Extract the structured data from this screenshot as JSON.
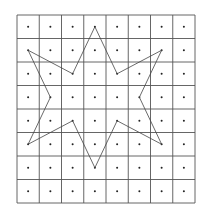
{
  "diagram": {
    "grid": {
      "columns": 8,
      "rows": 8,
      "left": 17,
      "top": 15,
      "right": 195,
      "bottom": 203,
      "line_color": "#555555",
      "dot_color": "#222222"
    },
    "star": {
      "stroke_color": "#444444",
      "vertices": [
        [
          3,
          0
        ],
        [
          4,
          2
        ],
        [
          6,
          1
        ],
        [
          5,
          3
        ],
        [
          6,
          5
        ],
        [
          4,
          4
        ],
        [
          3,
          6
        ],
        [
          2,
          4
        ],
        [
          0,
          5
        ],
        [
          1,
          3
        ],
        [
          0,
          1
        ],
        [
          2,
          2
        ]
      ]
    }
  }
}
